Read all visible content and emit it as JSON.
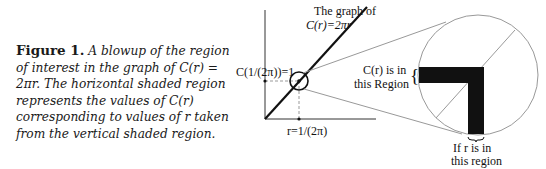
{
  "caption": {
    "label": "Figure 1.",
    "text": " A blowup of the region of interest in the graph of C(r) = 2πr. The horizontal shaded region represents the values of C(r) corresponding to values of r taken from the vertical shaded region."
  },
  "graph": {
    "title_line1": "The graph of",
    "title_line2": "C(r)=2πr",
    "y_marker_label": "C(1/(2π))=1",
    "x_marker_label": "r=1/(2π)"
  },
  "zoom": {
    "y_region_line1": "C(r) is in",
    "y_region_line2": "this Region",
    "y_brace": "{",
    "x_region_line1": "If r is in",
    "x_region_line2": "this region"
  },
  "colors": {
    "line": "#111111",
    "guide": "#9a9a9a",
    "shade": "#111111"
  }
}
